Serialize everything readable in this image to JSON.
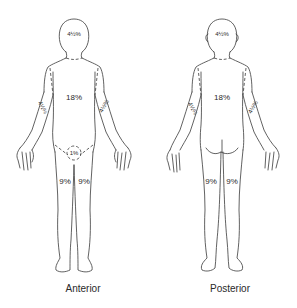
{
  "figures": {
    "anterior": {
      "caption": "Anterior",
      "regions": {
        "head": "4½%",
        "trunk": "18%",
        "right_arm": "4½%",
        "left_arm": "4½%",
        "genitalia": "1%",
        "right_leg": "9%",
        "left_leg": "9%"
      }
    },
    "posterior": {
      "caption": "Posterior",
      "regions": {
        "head": "4½%",
        "trunk": "18%",
        "left_arm": "4½%",
        "right_arm": "4½%",
        "left_leg": "9%",
        "right_leg": "9%"
      }
    }
  },
  "colors": {
    "line": "#3a3a3a",
    "text": "#2a2a2a",
    "background": "#ffffff"
  }
}
